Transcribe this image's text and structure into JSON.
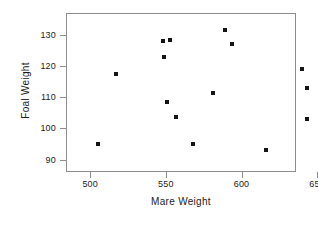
{
  "chart_data": {
    "type": "scatter",
    "title": "",
    "xlabel": "Mare Weight",
    "ylabel": "Foal Weight",
    "xlim": [
      484,
      636
    ],
    "ylim": [
      86,
      137
    ],
    "xticks": [
      500,
      550,
      600,
      650
    ],
    "yticks": [
      90,
      100,
      110,
      120,
      130
    ],
    "grid": false,
    "legend": null,
    "marker": "square",
    "marker_color": "#151515",
    "frame_color": "#8d8d8d",
    "points": [
      {
        "x": 505,
        "y": 95
      },
      {
        "x": 517,
        "y": 117.5
      },
      {
        "x": 548,
        "y": 128
      },
      {
        "x": 549,
        "y": 123
      },
      {
        "x": 551,
        "y": 108.5
      },
      {
        "x": 552.5,
        "y": 128.5
      },
      {
        "x": 557,
        "y": 103.5
      },
      {
        "x": 568,
        "y": 95
      },
      {
        "x": 581,
        "y": 111.5
      },
      {
        "x": 589,
        "y": 131.5
      },
      {
        "x": 594,
        "y": 127
      },
      {
        "x": 616,
        "y": 93
      },
      {
        "x": 640,
        "y": 119
      },
      {
        "x": 643,
        "y": 113
      },
      {
        "x": 643,
        "y": 103
      }
    ]
  },
  "axes": {
    "x": {
      "title": "Mare Weight",
      "tick_labels": [
        "500",
        "550",
        "600",
        "650"
      ]
    },
    "y": {
      "title": "Foal Weight",
      "tick_labels": [
        "90",
        "100",
        "110",
        "120",
        "130"
      ]
    }
  }
}
